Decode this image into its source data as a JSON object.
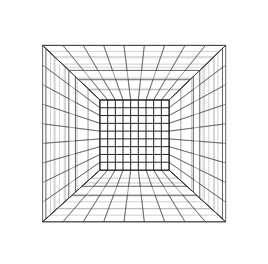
{
  "scene": {
    "title": "One-Point Perspective Grid Room",
    "type": "wireframe-perspective-diagram",
    "width": 268,
    "height": 264,
    "background_color": "#ffffff",
    "line_color": "#3a3a3a",
    "line_color_strong": "#222222",
    "line_color_faint": "#8a8a8a"
  },
  "camera": {
    "vanishing_point_x": 134,
    "vanishing_point_y": 134,
    "projection": "one-point-perspective"
  },
  "geometry": {
    "back_wall": {
      "label": "back-wall-grid",
      "left": 100,
      "top": 100,
      "right": 169,
      "bottom": 170,
      "columns": 9,
      "rows": 9,
      "stroke": "#222222",
      "stroke_width": 1.0
    },
    "room_opening_front": {
      "label": "front-aperture",
      "left": 18,
      "top": 22,
      "right": 250,
      "bottom": 244
    },
    "ceiling": {
      "label": "ceiling-grid",
      "segments": [
        {
          "name": "ceiling-strip-far",
          "near_depth": 0.3,
          "far_depth": 1.0,
          "cross_divisions": 9,
          "depth_divisions": 5
        },
        {
          "name": "ceiling-strip-mid",
          "near_depth": 0.62,
          "far_depth": 0.3,
          "cross_divisions": 9,
          "depth_divisions": 4
        },
        {
          "name": "ceiling-strip-near",
          "near_depth": 1.0,
          "far_depth": 0.74,
          "cross_divisions": 9,
          "depth_divisions": 2
        }
      ]
    },
    "floor": {
      "label": "floor-grid",
      "segments": [
        {
          "name": "floor-strip-far",
          "near_depth": 0.3,
          "far_depth": 1.0,
          "cross_divisions": 9,
          "depth_divisions": 4
        },
        {
          "name": "floor-strip-mid",
          "near_depth": 0.66,
          "far_depth": 0.3,
          "cross_divisions": 9,
          "depth_divisions": 4
        },
        {
          "name": "floor-strip-near",
          "near_depth": 1.0,
          "far_depth": 0.78,
          "cross_divisions": 9,
          "depth_divisions": 2
        }
      ]
    },
    "left_wall": {
      "label": "left-wall-panels",
      "panels": [
        {
          "name": "left-panel-far",
          "near_depth": 0.3,
          "far_depth": 1.0,
          "height_divisions": 9,
          "depth_divisions": 5
        },
        {
          "name": "left-panel-mid",
          "near_depth": 0.62,
          "far_depth": 0.34,
          "height_divisions": 9,
          "depth_divisions": 5
        },
        {
          "name": "left-panel-near",
          "near_depth": 1.0,
          "far_depth": 0.7,
          "height_divisions": 9,
          "depth_divisions": 2
        }
      ]
    },
    "right_wall": {
      "label": "right-wall-panels",
      "panels": [
        {
          "name": "right-panel-far",
          "near_depth": 0.3,
          "far_depth": 1.0,
          "height_divisions": 9,
          "depth_divisions": 5
        },
        {
          "name": "right-panel-mid",
          "near_depth": 0.62,
          "far_depth": 0.34,
          "height_divisions": 9,
          "depth_divisions": 5
        },
        {
          "name": "right-panel-near",
          "near_depth": 1.0,
          "far_depth": 0.7,
          "height_divisions": 9,
          "depth_divisions": 2
        }
      ]
    }
  },
  "render_hints": {
    "stroke_width_thin": 0.55,
    "stroke_width_med": 0.8,
    "stroke_width_back": 1.05,
    "shade_far_opacity": 0.9,
    "shade_near_opacity": 0.75
  }
}
